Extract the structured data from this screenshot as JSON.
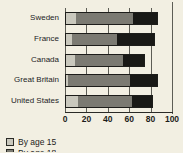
{
  "chart_data": {
    "type": "bar",
    "orientation": "horizontal",
    "stacked": true,
    "title": "",
    "xlabel": "",
    "ylabel": "",
    "xlim": [
      0,
      100
    ],
    "xticks": [
      0,
      20,
      40,
      60,
      80,
      100
    ],
    "xtick_labels": [
      "0",
      "20",
      "40",
      "60",
      "80",
      "100"
    ],
    "grid": true,
    "grid_axis": "x",
    "legend_position": "bottom-left",
    "categories": [
      "Sweden",
      "France",
      "Canada",
      "Great Britain",
      "United States"
    ],
    "series": [
      {
        "name": "By age 15",
        "color": "#c9c8bd",
        "values": [
          9,
          6,
          8,
          2,
          11
        ]
      },
      {
        "name": "By age 18",
        "color": "#7b7a72",
        "values": [
          54,
          42,
          45,
          58,
          51
        ]
      },
      {
        "name": "series-3",
        "color": "#191916",
        "values": [
          22,
          34,
          20,
          25,
          18
        ]
      }
    ],
    "totals": [
      85,
      82,
      73,
      85,
      80
    ],
    "cumulative": [
      [
        9,
        63,
        85
      ],
      [
        6,
        48,
        82
      ],
      [
        8,
        53,
        73
      ],
      [
        2,
        60,
        85
      ],
      [
        11,
        62,
        80
      ]
    ]
  },
  "legend": {
    "items": [
      {
        "label": "By age 15",
        "color": "#c9c8bd"
      },
      {
        "label": "By age 18",
        "color": "#7b7a72"
      }
    ]
  },
  "colors": {
    "background": "#f2efe2",
    "axis": "#5d5d55",
    "outline": "#1d1d1a",
    "text": "#23231f",
    "segment_1": "#c9c8bd",
    "segment_2": "#7b7a72",
    "segment_3": "#191916"
  }
}
